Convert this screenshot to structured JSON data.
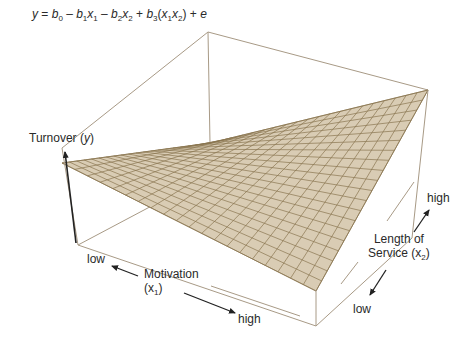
{
  "equation": {
    "y": "y",
    "eq": " = ",
    "b0": "b",
    "b0_sub": "0",
    "minus1": " – ",
    "b1": "b",
    "b1_sub": "1",
    "x1": "x",
    "x1_sub": "1",
    "minus2": " – ",
    "b2": "b",
    "b2_sub": "2",
    "x2": "x",
    "x2_sub": "2",
    "plus1": " + ",
    "b3": "b",
    "b3_sub": "3",
    "open": "(",
    "x1b": "x",
    "x1b_sub": "1",
    "x2b": "x",
    "x2b_sub": "2",
    "close": ")",
    "plus2": " + ",
    "e": "e"
  },
  "axes": {
    "y_axis": {
      "label": "Turnover (",
      "var": "y",
      "close": ")"
    },
    "x1_axis": {
      "label_line1": "Motivation",
      "label_line2_open": "(x",
      "sub": "1",
      "label_line2_close": ")",
      "low": "low",
      "high": "high"
    },
    "x2_axis": {
      "label_line1": "Length of",
      "label_line2_open": "Service (x",
      "sub": "2",
      "label_line2_close": ")",
      "low": "low",
      "high": "high"
    }
  },
  "colors": {
    "surface_fill": "#d9ccb4",
    "grid_line": "#8a7650",
    "box_line": "#a89a86",
    "arrow": "#222222",
    "text": "#2a2a2a"
  },
  "surface": {
    "grid_divisions_x1": 20,
    "grid_divisions_x2": 20
  }
}
